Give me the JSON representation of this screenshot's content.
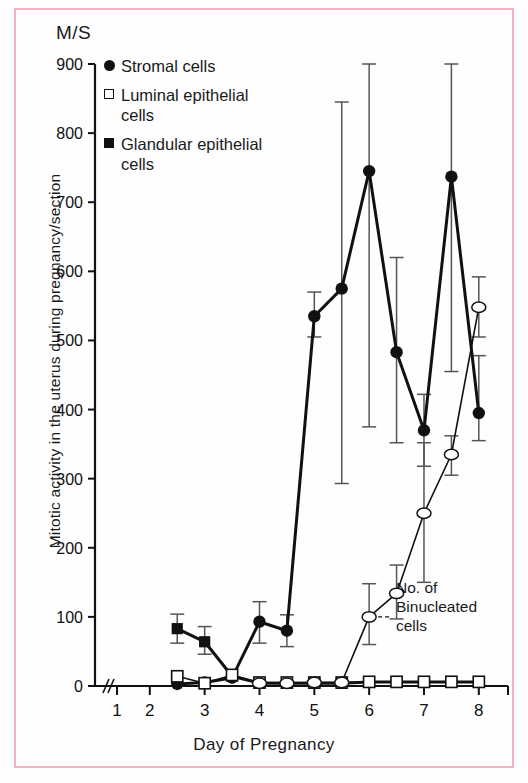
{
  "figure": {
    "unit_label": "M/S",
    "y_axis_title": "Mitotic activity in the uterus during pregnancy/section",
    "x_axis_title": "Day of Pregnancy",
    "annotation": "No. of\nBinucleated\ncells",
    "border_color": "#f2b4c0",
    "ink_color": "#111111"
  },
  "legend": {
    "items": [
      {
        "marker": "filled-circle",
        "label": "Stromal cells"
      },
      {
        "marker": "open-square",
        "label": "Luminal epithelial\ncells"
      },
      {
        "marker": "filled-square",
        "label": "Glandular epithelial\ncells"
      }
    ]
  },
  "chart_data": {
    "type": "line",
    "title": "",
    "xlabel": "Day of Pregnancy",
    "ylabel": "Mitotic activity in the uterus during pregnancy/section",
    "unit": "M/S",
    "xlim": [
      1,
      8.35
    ],
    "ylim": [
      0,
      900
    ],
    "ytick_labels": [
      "0",
      "100",
      "200",
      "300",
      "400",
      "500",
      "600",
      "700",
      "800",
      "900"
    ],
    "yticks": [
      0,
      100,
      200,
      300,
      400,
      500,
      600,
      700,
      800,
      900
    ],
    "xtick_labels": [
      "1",
      "2",
      "3",
      "4",
      "5",
      "6",
      "7",
      "8"
    ],
    "xticks": [
      1,
      2,
      3,
      4,
      5,
      6,
      7,
      8
    ],
    "grid": false,
    "axis_break_x": true,
    "legend_position": "top-left-inside",
    "series": [
      {
        "name": "Stromal cells",
        "marker": "filled-circle",
        "x": [
          2.5,
          3.0,
          3.5,
          4.0,
          4.5,
          5.0,
          5.5,
          6.0,
          6.5,
          7.0,
          7.5,
          8.0
        ],
        "values": [
          3,
          5,
          12,
          93,
          80,
          535,
          575,
          745,
          483,
          370,
          737,
          395
        ],
        "err_low": [
          0,
          0,
          0,
          62,
          57,
          505,
          293,
          375,
          352,
          318,
          455,
          355
        ],
        "err_high": [
          0,
          0,
          0,
          122,
          103,
          570,
          845,
          900,
          620,
          422,
          900,
          478
        ]
      },
      {
        "name": "Glandular epithelial cells",
        "marker": "filled-square",
        "x": [
          2.5,
          3.0,
          3.5,
          4.0,
          4.5,
          5.0,
          5.5,
          6.0,
          6.5,
          7.0,
          7.5,
          8.0
        ],
        "values": [
          83,
          64,
          14,
          4,
          4,
          4,
          4,
          6,
          6,
          6,
          6,
          6
        ],
        "err_low": [
          62,
          46,
          0,
          0,
          0,
          0,
          0,
          0,
          0,
          0,
          0,
          0
        ],
        "err_high": [
          104,
          86,
          0,
          0,
          0,
          0,
          0,
          0,
          0,
          0,
          0,
          0
        ]
      },
      {
        "name": "Luminal epithelial cells",
        "marker": "open-square",
        "x": [
          2.5,
          3.0,
          3.5,
          4.0,
          4.5,
          5.0,
          5.5,
          6.0,
          6.5,
          7.0,
          7.5,
          8.0
        ],
        "values": [
          14,
          4,
          16,
          5,
          5,
          5,
          5,
          6,
          6,
          6,
          6,
          6
        ],
        "err_low": [
          0,
          0,
          0,
          0,
          0,
          0,
          0,
          0,
          0,
          0,
          0,
          0
        ],
        "err_high": [
          0,
          0,
          0,
          0,
          0,
          0,
          0,
          0,
          0,
          0,
          0,
          0
        ]
      },
      {
        "name": "No. of Binucleated cells",
        "marker": "open-circle",
        "x": [
          4.0,
          4.5,
          5.0,
          5.5,
          6.0,
          6.5,
          7.0,
          7.5,
          8.0
        ],
        "values": [
          4,
          4,
          5,
          5,
          100,
          134,
          250,
          335,
          548
        ],
        "err_low": [
          0,
          0,
          0,
          0,
          60,
          97,
          150,
          305,
          505
        ],
        "err_high": [
          0,
          0,
          0,
          0,
          148,
          175,
          352,
          362,
          592
        ]
      }
    ]
  }
}
